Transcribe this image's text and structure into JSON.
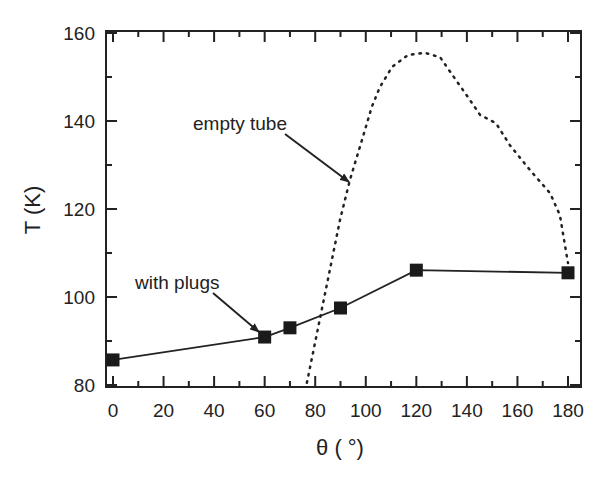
{
  "chart_data": {
    "type": "line",
    "title": "",
    "xlabel": "θ ( °)",
    "ylabel": "T (K)",
    "xlim": [
      0,
      180
    ],
    "ylim": [
      80,
      160
    ],
    "xticks": [
      0,
      20,
      40,
      60,
      80,
      100,
      120,
      140,
      160,
      180
    ],
    "yticks": [
      80,
      100,
      120,
      140,
      160
    ],
    "grid": false,
    "legend": "none (inline annotations with arrows)",
    "series": [
      {
        "name": "with plugs",
        "style": "solid line with filled square markers",
        "x": [
          0,
          60,
          70,
          90,
          120,
          180
        ],
        "y": [
          85.7,
          90.9,
          93.0,
          97.5,
          106.1,
          105.5
        ]
      },
      {
        "name": "empty tube",
        "style": "dotted line, no markers",
        "x": [
          76.7,
          89.8,
          93.7,
          98.5,
          102.4,
          105.6,
          110.4,
          116.7,
          123.4,
          129.4,
          135.7,
          141.2,
          145.2,
          151.5,
          157.0,
          164.9,
          172.9,
          176.8,
          180.0
        ],
        "y": [
          80.5,
          117.5,
          126.6,
          135.7,
          143.2,
          147.7,
          152.3,
          155.0,
          155.5,
          154.5,
          149.3,
          144.8,
          141.4,
          139.5,
          134.5,
          128.9,
          123.6,
          118.6,
          107.7
        ]
      }
    ],
    "annotations": [
      {
        "text": "empty tube",
        "points_to_series": "empty tube",
        "arrow_target": [
          93,
          125
        ]
      },
      {
        "text": "with plugs",
        "points_to_series": "with plugs",
        "arrow_target": [
          60,
          91
        ]
      }
    ]
  },
  "labels": {
    "xlabel": "θ ( °)",
    "ylabel": "T (K)",
    "annot_empty": "empty tube",
    "annot_plugs": "with plugs"
  }
}
